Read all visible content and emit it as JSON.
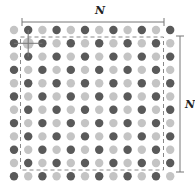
{
  "labels": {
    "top": "N",
    "right": "N"
  },
  "grid": {
    "rows": 12,
    "cols": 12,
    "x0": 14,
    "dx": 14.2,
    "y0": 30,
    "dy": 13.3,
    "radius": 4.2,
    "dark_color": "#5a5a5a",
    "light_color": "#c4c4c4",
    "pattern": "checkerboard-dark-when-row-plus-col-odd",
    "highlight": {
      "row": 1,
      "col": 1
    }
  },
  "dashed_box": {
    "x": 20.5,
    "y": 37,
    "w": 143,
    "h": 133,
    "color": "#888888"
  },
  "top_bracket": {
    "x1": 22,
    "x2": 164,
    "y": 22
  },
  "right_bracket": {
    "x": 180,
    "y1": 36,
    "y2": 172
  }
}
